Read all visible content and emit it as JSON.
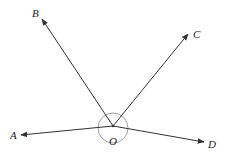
{
  "diagram": {
    "title": "",
    "vertex": {
      "label": "O",
      "x": 113,
      "y": 126
    },
    "rays": [
      {
        "id": "OA",
        "label": "A",
        "tip": [
          21,
          135
        ],
        "label_pos": [
          14,
          139
        ]
      },
      {
        "id": "OB",
        "label": "B",
        "tip": [
          42,
          19
        ],
        "label_pos": [
          36,
          17
        ]
      },
      {
        "id": "OC",
        "label": "C",
        "tip": [
          188,
          34
        ],
        "label_pos": [
          196,
          38
        ]
      },
      {
        "id": "OD",
        "label": "D",
        "tip": [
          204,
          142
        ],
        "label_pos": [
          212,
          148
        ]
      }
    ],
    "angle_circle": {
      "cx": 113,
      "cy": 128,
      "r": 15
    },
    "colors": {
      "line": "#333333",
      "circle": "#888888",
      "text": "#222222"
    }
  }
}
